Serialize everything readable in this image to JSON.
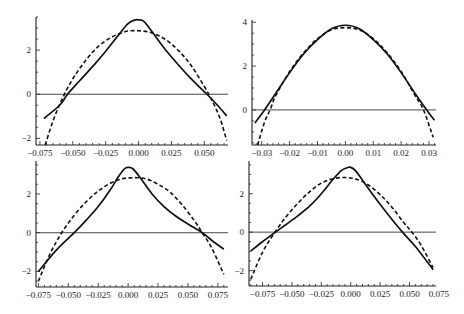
{
  "figure": {
    "width": 464,
    "height": 314
  },
  "chart_data": [
    {
      "type": "line",
      "panel": "top-left",
      "title": "",
      "xlabel": "",
      "ylabel": "",
      "xlim": [
        -0.078,
        0.068
      ],
      "ylim": [
        -2.3,
        3.5
      ],
      "xticks": [
        -0.075,
        -0.05,
        -0.025,
        0.0,
        0.025,
        0.05
      ],
      "xtick_labels": [
        "−0.075",
        "−0.050",
        "−0.025",
        "0.000",
        "0.025",
        "0.050"
      ],
      "yticks": [
        -2,
        0,
        2
      ],
      "ytick_labels": [
        "−2",
        "0",
        "2"
      ],
      "zero_line": true,
      "grid": false,
      "series": [
        {
          "name": "solid",
          "style": "solid",
          "x": [
            -0.072,
            -0.06,
            -0.054,
            -0.045,
            -0.035,
            -0.025,
            -0.015,
            -0.008,
            -0.003,
            0.0,
            0.004,
            0.01,
            0.02,
            0.03,
            0.04,
            0.052,
            0.06,
            0.067
          ],
          "y": [
            -1.1,
            -0.5,
            0.0,
            0.6,
            1.25,
            1.95,
            2.7,
            3.2,
            3.36,
            3.37,
            3.3,
            2.85,
            2.05,
            1.35,
            0.7,
            0.0,
            -0.5,
            -0.98
          ]
        },
        {
          "name": "dashed",
          "style": "dashed",
          "x": [
            -0.071,
            -0.065,
            -0.058,
            -0.05,
            -0.04,
            -0.03,
            -0.02,
            -0.01,
            0.0,
            0.01,
            0.02,
            0.03,
            0.04,
            0.05,
            0.056,
            0.062,
            0.067
          ],
          "y": [
            -2.3,
            -1.2,
            -0.2,
            0.7,
            1.55,
            2.2,
            2.6,
            2.84,
            2.88,
            2.78,
            2.5,
            2.0,
            1.3,
            0.35,
            -0.3,
            -1.1,
            -2.1
          ]
        }
      ]
    },
    {
      "type": "line",
      "panel": "top-right",
      "title": "",
      "xlabel": "",
      "ylabel": "",
      "xlim": [
        -0.0335,
        0.0325
      ],
      "ylim": [
        -1.6,
        4.1
      ],
      "xticks": [
        -0.03,
        -0.02,
        -0.01,
        0.0,
        0.01,
        0.02,
        0.03
      ],
      "xtick_labels": [
        "−0.03",
        "−0.02",
        "−0.01",
        "0.00",
        "0.01",
        "0.02",
        "0.03"
      ],
      "yticks": [
        0,
        2,
        4
      ],
      "ytick_labels": [
        "0",
        "2",
        "4"
      ],
      "zero_line": true,
      "grid": false,
      "series": [
        {
          "name": "solid",
          "style": "solid",
          "x": [
            -0.0325,
            -0.029,
            -0.025,
            -0.02,
            -0.015,
            -0.01,
            -0.005,
            0.0,
            0.005,
            0.01,
            0.015,
            0.02,
            0.025,
            0.03,
            0.032
          ],
          "y": [
            -0.6,
            0.0,
            0.75,
            1.7,
            2.55,
            3.2,
            3.7,
            3.86,
            3.7,
            3.2,
            2.55,
            1.7,
            0.75,
            -0.15,
            -0.47
          ]
        },
        {
          "name": "dashed",
          "style": "dashed",
          "x": [
            -0.0315,
            -0.029,
            -0.027,
            -0.025,
            -0.02,
            -0.015,
            -0.01,
            -0.005,
            0.0,
            0.005,
            0.01,
            0.015,
            0.02,
            0.025,
            0.028,
            0.0315
          ],
          "y": [
            -1.6,
            -0.55,
            0.0,
            0.65,
            1.75,
            2.6,
            3.25,
            3.65,
            3.75,
            3.65,
            3.25,
            2.6,
            1.75,
            0.65,
            0.0,
            -1.25
          ]
        }
      ]
    },
    {
      "type": "line",
      "panel": "bottom-left",
      "title": "",
      "xlabel": "",
      "ylabel": "",
      "xlim": [
        -0.077,
        0.0835
      ],
      "ylim": [
        -2.8,
        3.7
      ],
      "xticks": [
        -0.075,
        -0.05,
        -0.025,
        0.0,
        0.025,
        0.05,
        0.075
      ],
      "xtick_labels": [
        "−0.075",
        "−0.050",
        "−0.025",
        "0.000",
        "0.025",
        "0.050",
        "0.075"
      ],
      "yticks": [
        -2,
        0,
        2
      ],
      "ytick_labels": [
        "−2",
        "0",
        "2"
      ],
      "zero_line": true,
      "grid": false,
      "series": [
        {
          "name": "solid",
          "style": "solid",
          "x": [
            -0.075,
            -0.06,
            -0.045,
            -0.035,
            -0.025,
            -0.015,
            -0.008,
            -0.003,
            0.0,
            0.004,
            0.01,
            0.02,
            0.03,
            0.04,
            0.05,
            0.062,
            0.07,
            0.08
          ],
          "y": [
            -2.0,
            -0.9,
            0.0,
            0.65,
            1.35,
            2.2,
            2.9,
            3.3,
            3.37,
            3.3,
            2.85,
            2.0,
            1.35,
            0.85,
            0.45,
            0.0,
            -0.4,
            -0.85
          ]
        },
        {
          "name": "dashed",
          "style": "dashed",
          "x": [
            -0.075,
            -0.065,
            -0.055,
            -0.045,
            -0.035,
            -0.025,
            -0.015,
            -0.005,
            0.005,
            0.015,
            0.025,
            0.035,
            0.045,
            0.055,
            0.062,
            0.07,
            0.08
          ],
          "y": [
            -2.5,
            -1.05,
            0.05,
            0.9,
            1.6,
            2.15,
            2.55,
            2.78,
            2.84,
            2.78,
            2.5,
            2.1,
            1.45,
            0.65,
            0.0,
            -0.8,
            -2.15
          ]
        }
      ]
    },
    {
      "type": "line",
      "panel": "bottom-right",
      "title": "",
      "xlabel": "",
      "ylabel": "",
      "xlim": [
        -0.0865,
        0.0725
      ],
      "ylim": [
        -2.8,
        3.7
      ],
      "xticks": [
        -0.075,
        -0.05,
        -0.025,
        0.0,
        0.025,
        0.05,
        0.075
      ],
      "xtick_labels": [
        "−0.075",
        "−0.050",
        "−0.025",
        "0.000",
        "0.025",
        "0.050",
        "0.075"
      ],
      "yticks": [
        -2,
        0,
        2
      ],
      "ytick_labels": [
        "−2",
        "0",
        "2"
      ],
      "zero_line": true,
      "grid": false,
      "series": [
        {
          "name": "solid",
          "style": "solid",
          "x": [
            -0.085,
            -0.075,
            -0.064,
            -0.055,
            -0.045,
            -0.035,
            -0.025,
            -0.015,
            -0.008,
            -0.003,
            0.0,
            0.004,
            0.01,
            0.02,
            0.03,
            0.044,
            0.055,
            0.07
          ],
          "y": [
            -0.98,
            -0.5,
            0.0,
            0.4,
            0.85,
            1.35,
            2.0,
            2.75,
            3.2,
            3.35,
            3.37,
            3.2,
            2.7,
            1.85,
            1.05,
            0.0,
            -0.75,
            -1.95
          ]
        },
        {
          "name": "dashed",
          "style": "dashed",
          "x": [
            -0.085,
            -0.075,
            -0.065,
            -0.055,
            -0.045,
            -0.035,
            -0.025,
            -0.015,
            -0.005,
            0.005,
            0.015,
            0.025,
            0.035,
            0.045,
            0.052,
            0.06,
            0.07
          ],
          "y": [
            -2.45,
            -1.05,
            -0.05,
            0.8,
            1.5,
            2.1,
            2.55,
            2.78,
            2.84,
            2.75,
            2.45,
            1.95,
            1.3,
            0.5,
            0.0,
            -0.7,
            -1.85
          ]
        }
      ]
    }
  ],
  "panels": [
    {
      "box": {
        "left": 36,
        "top": 17,
        "right": 228,
        "bottom": 145
      }
    },
    {
      "box": {
        "left": 252,
        "top": 20,
        "right": 436,
        "bottom": 145
      }
    },
    {
      "box": {
        "left": 36,
        "top": 161,
        "right": 228,
        "bottom": 287
      }
    },
    {
      "box": {
        "left": 249,
        "top": 161,
        "right": 436,
        "bottom": 286
      }
    }
  ]
}
